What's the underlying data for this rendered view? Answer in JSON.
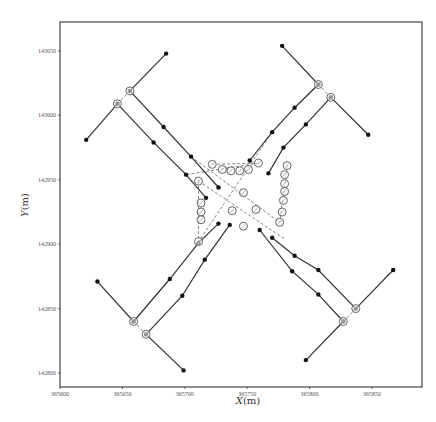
{
  "chart_data": {
    "type": "scatter",
    "title": "",
    "xlabel": "X(m)",
    "ylabel": "Y(m)",
    "xlim": [
      365600,
      365890
    ],
    "ylim": [
      142790,
      143070
    ],
    "grid": false,
    "legend": null,
    "x_ticks": [
      365600,
      365650,
      365700,
      365750,
      365800,
      365850
    ],
    "y_ticks": [
      142800,
      142850,
      142900,
      142950,
      143000,
      143050
    ],
    "x_tick_labels": [
      "365600",
      "365650",
      "365700",
      "365750",
      "365800",
      "365850"
    ],
    "y_tick_labels": [
      "142800",
      "142850",
      "142900",
      "142950",
      "143000",
      "143050"
    ],
    "series": [
      {
        "name": "solid_links",
        "style": "solid line with filled dot markers",
        "polylines": [
          [
            [
              365685,
              143048
            ],
            [
              365656,
              143019
            ]
          ],
          [
            [
              365656,
              143019
            ],
            [
              365683,
              142991
            ],
            [
              365705,
              142968
            ],
            [
              365727,
              142944
            ]
          ],
          [
            [
              365646,
              143009
            ],
            [
              365621,
              142981
            ]
          ],
          [
            [
              365646,
              143009
            ],
            [
              365675,
              142979
            ],
            [
              365701,
              142954
            ],
            [
              365717,
              142936
            ]
          ],
          [
            [
              365778,
              143054
            ],
            [
              365807,
              143024
            ]
          ],
          [
            [
              365807,
              143024
            ],
            [
              365788,
              143006
            ],
            [
              365770,
              142987
            ],
            [
              365752,
              142965
            ]
          ],
          [
            [
              365817,
              143014
            ],
            [
              365847,
              142985
            ]
          ],
          [
            [
              365817,
              143014
            ],
            [
              365797,
              142993
            ],
            [
              365779,
              142975
            ],
            [
              365767,
              142955
            ]
          ],
          [
            [
              365630,
              142871
            ],
            [
              365659,
              142840
            ]
          ],
          [
            [
              365659,
              142840
            ],
            [
              365688,
              142873
            ],
            [
              365711,
              142901
            ],
            [
              365727,
              142916
            ]
          ],
          [
            [
              365669,
              142830
            ],
            [
              365699,
              142802
            ]
          ],
          [
            [
              365669,
              142830
            ],
            [
              365698,
              142860
            ],
            [
              365716,
              142888
            ],
            [
              365736,
              142915
            ]
          ],
          [
            [
              365867,
              142880
            ],
            [
              365837,
              142850
            ]
          ],
          [
            [
              365837,
              142850
            ],
            [
              365807,
              142880
            ],
            [
              365788,
              142891
            ],
            [
              365770,
              142905
            ]
          ],
          [
            [
              365827,
              142840
            ],
            [
              365797,
              142810
            ]
          ],
          [
            [
              365827,
              142840
            ],
            [
              365807,
              142861
            ],
            [
              365786,
              142879
            ],
            [
              365760,
              142911
            ]
          ]
        ]
      },
      {
        "name": "nodes_open_circle",
        "style": "open circle markers",
        "points": [
          [
            365656,
            143019
          ],
          [
            365646,
            143009
          ],
          [
            365807,
            143024
          ],
          [
            365817,
            143014
          ],
          [
            365659,
            142840
          ],
          [
            365669,
            142830
          ],
          [
            365837,
            142850
          ],
          [
            365827,
            142840
          ],
          [
            365722,
            142962
          ],
          [
            365730,
            142958
          ],
          [
            365737,
            142957
          ],
          [
            365744,
            142957
          ],
          [
            365751,
            142958
          ],
          [
            365759,
            142963
          ],
          [
            365711,
            142949
          ],
          [
            365713,
            142932
          ],
          [
            365713,
            142925
          ],
          [
            365713,
            142919
          ],
          [
            365711,
            142902
          ],
          [
            365782,
            142961
          ],
          [
            365780,
            142954
          ],
          [
            365780,
            142947
          ],
          [
            365780,
            142941
          ],
          [
            365779,
            142934
          ],
          [
            365778,
            142925
          ],
          [
            365776,
            142917
          ],
          [
            365747,
            142940
          ],
          [
            365738,
            142926
          ],
          [
            365757,
            142927
          ],
          [
            365747,
            142914
          ]
        ]
      },
      {
        "name": "dashed_connectors",
        "style": "dashed line",
        "segments": [
          [
            [
              365656,
              143019
            ],
            [
              365646,
              143009
            ]
          ],
          [
            [
              365807,
              143024
            ],
            [
              365817,
              143014
            ]
          ],
          [
            [
              365659,
              142840
            ],
            [
              365669,
              142830
            ]
          ],
          [
            [
              365837,
              142850
            ],
            [
              365827,
              142840
            ]
          ],
          [
            [
              365722,
              142962
            ],
            [
              365759,
              142963
            ]
          ],
          [
            [
              365711,
              142949
            ],
            [
              365711,
              142902
            ]
          ],
          [
            [
              365782,
              142961
            ],
            [
              365776,
              142917
            ]
          ],
          [
            [
              365705,
              142968
            ],
            [
              365776,
              142917
            ]
          ],
          [
            [
              365770,
              142987
            ],
            [
              365711,
              142902
            ]
          ],
          [
            [
              365711,
              142949
            ],
            [
              365780,
              142904
            ]
          ],
          [
            [
              365759,
              142963
            ],
            [
              365701,
              142954
            ]
          ]
        ]
      }
    ]
  },
  "labels": {
    "x_axis": "X",
    "x_unit": "(m)",
    "y_axis": "Y",
    "y_unit": "(m)"
  }
}
